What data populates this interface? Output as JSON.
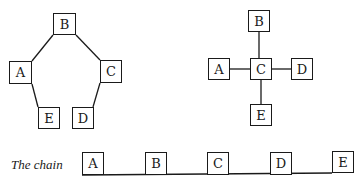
{
  "diagrams": {
    "pentagon": {
      "nodes": [
        {
          "id": "B",
          "label": "B",
          "x": 53,
          "y": 13,
          "w": 23,
          "h": 22
        },
        {
          "id": "A",
          "label": "A",
          "x": 9,
          "y": 61,
          "w": 23,
          "h": 23
        },
        {
          "id": "C",
          "label": "C",
          "x": 100,
          "y": 60,
          "w": 22,
          "h": 23
        },
        {
          "id": "E",
          "label": "E",
          "x": 38,
          "y": 107,
          "w": 22,
          "h": 22
        },
        {
          "id": "D",
          "label": "D",
          "x": 72,
          "y": 107,
          "w": 22,
          "h": 22
        }
      ],
      "edges": [
        [
          "B",
          "C"
        ],
        [
          "C",
          "D"
        ],
        [
          "A",
          "E"
        ],
        [
          "A",
          "B"
        ]
      ]
    },
    "star": {
      "nodes": [
        {
          "id": "B",
          "label": "B",
          "x": 248,
          "y": 10,
          "w": 22,
          "h": 22
        },
        {
          "id": "A",
          "label": "A",
          "x": 208,
          "y": 58,
          "w": 22,
          "h": 22
        },
        {
          "id": "C",
          "label": "C",
          "x": 250,
          "y": 58,
          "w": 22,
          "h": 22
        },
        {
          "id": "D",
          "label": "D",
          "x": 291,
          "y": 58,
          "w": 22,
          "h": 22
        },
        {
          "id": "E",
          "label": "E",
          "x": 250,
          "y": 104,
          "w": 22,
          "h": 22
        }
      ],
      "edges": [
        [
          "C",
          "A"
        ],
        [
          "C",
          "B"
        ],
        [
          "C",
          "D"
        ],
        [
          "C",
          "E"
        ]
      ]
    },
    "chain": {
      "label": "The chain",
      "nodes": [
        {
          "id": "A",
          "label": "A",
          "x": 82,
          "y": 152,
          "w": 22,
          "h": 23
        },
        {
          "id": "B",
          "label": "B",
          "x": 145,
          "y": 152,
          "w": 22,
          "h": 23
        },
        {
          "id": "C",
          "label": "C",
          "x": 207,
          "y": 152,
          "w": 22,
          "h": 23
        },
        {
          "id": "D",
          "label": "D",
          "x": 270,
          "y": 152,
          "w": 22,
          "h": 23
        },
        {
          "id": "E",
          "label": "E",
          "x": 332,
          "y": 151,
          "w": 22,
          "h": 22
        }
      ],
      "baseline_y": 175
    }
  }
}
